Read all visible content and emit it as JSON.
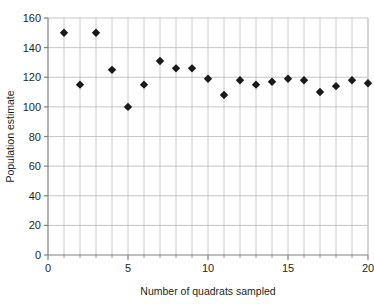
{
  "chart_data": {
    "type": "scatter",
    "title": "",
    "xlabel": "Number of quadrats sampled",
    "ylabel": "Population estimate",
    "xlim": [
      0,
      20
    ],
    "ylim": [
      0,
      160
    ],
    "xticks": [
      0,
      5,
      10,
      15,
      20
    ],
    "yticks": [
      0,
      20,
      40,
      60,
      80,
      100,
      120,
      140,
      160
    ],
    "xtick_labels": [
      "0",
      "5",
      "10",
      "15",
      "20"
    ],
    "ytick_labels": [
      "0",
      "20",
      "40",
      "60",
      "80",
      "100",
      "120",
      "140",
      "160"
    ],
    "x_minor_tick_step": 1,
    "grid": "vertical-minor-and-horizontal-major",
    "legend": "none",
    "marker": "diamond",
    "marker_color": "#1a1a1a",
    "grid_color": "#bfbfbf",
    "axis_color": "#808080",
    "x": [
      1,
      2,
      3,
      4,
      5,
      6,
      7,
      8,
      9,
      10,
      11,
      12,
      13,
      14,
      15,
      16,
      17,
      18,
      19,
      20
    ],
    "values": [
      150,
      115,
      150,
      125,
      100,
      115,
      131,
      126,
      126,
      119,
      108,
      118,
      115,
      117,
      119,
      118,
      110,
      114,
      118,
      116
    ],
    "series": [
      {
        "name": "Population estimate",
        "values": [
          150,
          115,
          150,
          125,
          100,
          115,
          131,
          126,
          126,
          119,
          108,
          118,
          115,
          117,
          119,
          118,
          110,
          114,
          118,
          116
        ]
      }
    ]
  }
}
